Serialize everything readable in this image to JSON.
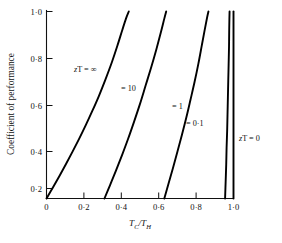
{
  "figure": {
    "background": "#ffffff",
    "ink": "#111111"
  },
  "chart_data": {
    "type": "line",
    "title": "",
    "xlabel": "T_C/T_H",
    "xlabel_parts": {
      "lead": "T",
      "lead_sub": "C",
      "slash": "/",
      "trail": "T",
      "trail_sub": "H"
    },
    "ylabel": "Coefficient of performance",
    "xlim": [
      0,
      1.0
    ],
    "ylim": [
      0,
      1.0
    ],
    "grid": false,
    "legend_position": "inline-curve-labels",
    "xticks": [
      0,
      0.2,
      0.4,
      0.6,
      0.8,
      1.0
    ],
    "xticklabels": [
      "0",
      "0·2",
      "0·4",
      "0·6",
      "0·8",
      "1·0"
    ],
    "yticks": [
      0.2,
      0.4,
      0.6,
      0.8,
      1.0
    ],
    "yticklabels": [
      "0·2",
      "0·4",
      "0·6",
      "0·8",
      "1·0"
    ],
    "series": [
      {
        "name": "zT = ∞",
        "label": "zT = ∞",
        "label_var": "z",
        "label_rest": "T = ∞",
        "zT": "infinity",
        "x": [
          0.0,
          0.035,
          0.07,
          0.105,
          0.14,
          0.175,
          0.21,
          0.245,
          0.28,
          0.315,
          0.35,
          0.38,
          0.405,
          0.425,
          0.44
        ],
        "y": [
          0.0,
          0.06,
          0.122,
          0.186,
          0.252,
          0.32,
          0.392,
          0.468,
          0.548,
          0.636,
          0.73,
          0.82,
          0.9,
          0.962,
          1.0
        ]
      },
      {
        "name": "= 10",
        "label": "= 10",
        "label_var": "",
        "label_rest": "= 10",
        "zT": "10",
        "x": [
          0.31,
          0.34,
          0.372,
          0.404,
          0.436,
          0.468,
          0.5,
          0.53,
          0.56,
          0.588,
          0.612,
          0.63,
          0.64
        ],
        "y": [
          0.0,
          0.072,
          0.15,
          0.232,
          0.318,
          0.41,
          0.506,
          0.604,
          0.702,
          0.8,
          0.89,
          0.962,
          1.0
        ]
      },
      {
        "name": "= 1",
        "label": "= 1",
        "label_var": "",
        "label_rest": "= 1",
        "zT": "1",
        "x": [
          0.63,
          0.652,
          0.676,
          0.7,
          0.724,
          0.748,
          0.77,
          0.792,
          0.812,
          0.83,
          0.846,
          0.858,
          0.866
        ],
        "y": [
          0.0,
          0.078,
          0.162,
          0.25,
          0.34,
          0.434,
          0.528,
          0.624,
          0.72,
          0.816,
          0.902,
          0.964,
          1.0
        ]
      },
      {
        "name": "= 0·1",
        "label": "= 0·1",
        "label_var": "",
        "label_rest": "= 0·1",
        "zT": "0.1",
        "x": [
          0.955,
          0.958,
          0.961,
          0.963,
          0.966,
          0.968,
          0.97,
          0.972,
          0.974,
          0.976,
          0.977,
          0.978,
          0.979
        ],
        "y": [
          0.0,
          0.09,
          0.18,
          0.27,
          0.36,
          0.45,
          0.54,
          0.63,
          0.72,
          0.81,
          0.9,
          0.96,
          1.0
        ]
      },
      {
        "name": "zT = 0",
        "label": "zT = 0",
        "label_var": "z",
        "label_rest": "T = 0",
        "zT": "0",
        "x": [
          1.0,
          1.0
        ],
        "y": [
          0.0,
          1.0
        ]
      }
    ],
    "annotations": [
      {
        "text": "zT = ∞",
        "var": "z",
        "rest": "T = ∞",
        "x_px": 74,
        "y_px": 70
      },
      {
        "text": "= 10",
        "var": "",
        "rest": "= 10",
        "x_px": 121,
        "y_px": 89
      },
      {
        "text": "= 1",
        "var": "",
        "rest": "= 1",
        "x_px": 172,
        "y_px": 107
      },
      {
        "text": "= 0·1",
        "var": "",
        "rest": "= 0·1",
        "x_px": 186,
        "y_px": 124
      },
      {
        "text": "zT = 0",
        "var": "z",
        "rest": "T = 0",
        "x_px": 237,
        "y_px": 139
      }
    ]
  }
}
